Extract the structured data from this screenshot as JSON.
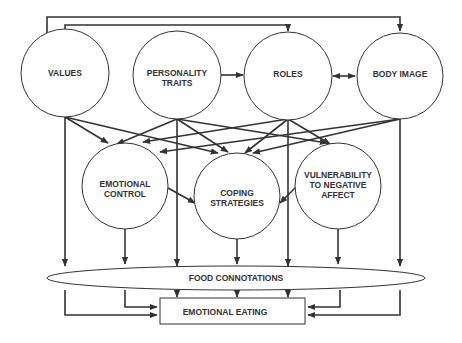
{
  "diagram": {
    "nodes": {
      "values": {
        "line1": "VALUES"
      },
      "personality": {
        "line1": "PERSONALITY",
        "line2": "TRAITS"
      },
      "roles": {
        "line1": "ROLES"
      },
      "body_image": {
        "line1": "BODY IMAGE"
      },
      "emotional_control": {
        "line1": "EMOTIONAL",
        "line2": "CONTROL"
      },
      "coping": {
        "line1": "COPING",
        "line2": "STRATEGIES"
      },
      "vulnerability": {
        "line1": "VULNERABILITY",
        "line2": "TO NEGATIVE",
        "line3": "AFFECT"
      },
      "food_connotations": {
        "line1": "FOOD CONNOTATIONS"
      },
      "emotional_eating": {
        "line1": "EMOTIONAL EATING"
      }
    },
    "edges": [
      {
        "from": "VALUES",
        "to": "ROLES"
      },
      {
        "from": "VALUES",
        "to": "BODY IMAGE"
      },
      {
        "from": "PERSONALITY TRAITS",
        "to": "ROLES"
      },
      {
        "from": "ROLES",
        "to": "BODY IMAGE",
        "bidirectional": true
      },
      {
        "from": "VALUES",
        "to": "EMOTIONAL CONTROL"
      },
      {
        "from": "VALUES",
        "to": "COPING STRATEGIES"
      },
      {
        "from": "PERSONALITY TRAITS",
        "to": "EMOTIONAL CONTROL"
      },
      {
        "from": "PERSONALITY TRAITS",
        "to": "VULNERABILITY TO NEGATIVE AFFECT"
      },
      {
        "from": "ROLES",
        "to": "EMOTIONAL CONTROL"
      },
      {
        "from": "ROLES",
        "to": "COPING STRATEGIES"
      },
      {
        "from": "ROLES",
        "to": "VULNERABILITY TO NEGATIVE AFFECT"
      },
      {
        "from": "BODY IMAGE",
        "to": "EMOTIONAL CONTROL"
      },
      {
        "from": "BODY IMAGE",
        "to": "COPING STRATEGIES"
      },
      {
        "from": "EMOTIONAL CONTROL",
        "to": "COPING STRATEGIES"
      },
      {
        "from": "VULNERABILITY TO NEGATIVE AFFECT",
        "to": "COPING STRATEGIES"
      },
      {
        "from": "VALUES",
        "to": "FOOD CONNOTATIONS"
      },
      {
        "from": "PERSONALITY TRAITS",
        "to": "FOOD CONNOTATIONS"
      },
      {
        "from": "ROLES",
        "to": "FOOD CONNOTATIONS"
      },
      {
        "from": "BODY IMAGE",
        "to": "FOOD CONNOTATIONS"
      },
      {
        "from": "EMOTIONAL CONTROL",
        "to": "FOOD CONNOTATIONS"
      },
      {
        "from": "COPING STRATEGIES",
        "to": "FOOD CONNOTATIONS"
      },
      {
        "from": "VULNERABILITY TO NEGATIVE AFFECT",
        "to": "FOOD CONNOTATIONS"
      },
      {
        "from": "FOOD CONNOTATIONS",
        "to": "EMOTIONAL EATING"
      },
      {
        "from": "VALUES",
        "to": "EMOTIONAL EATING"
      },
      {
        "from": "EMOTIONAL CONTROL",
        "to": "EMOTIONAL EATING"
      },
      {
        "from": "VULNERABILITY TO NEGATIVE AFFECT",
        "to": "EMOTIONAL EATING"
      },
      {
        "from": "BODY IMAGE",
        "to": "EMOTIONAL EATING"
      }
    ],
    "colors": {
      "stroke": "#333333",
      "background": "#ffffff",
      "text": "#333333"
    }
  }
}
